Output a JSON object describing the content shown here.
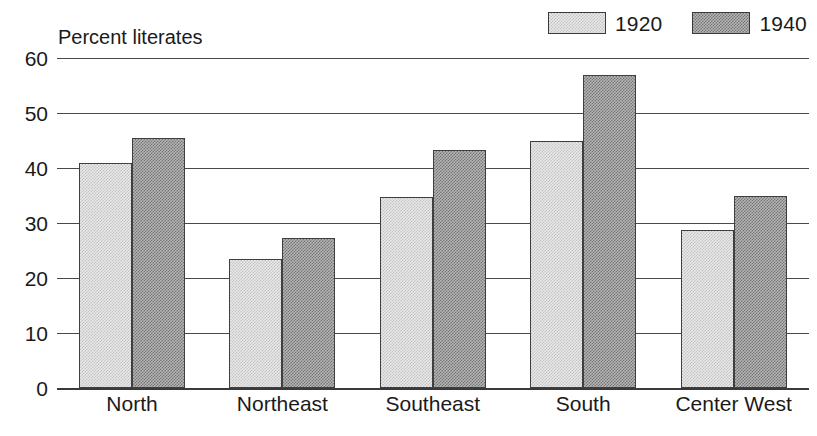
{
  "chart_data": {
    "type": "bar",
    "title": "Percent literates",
    "xlabel": "",
    "ylabel": "Percent literates",
    "ylim": [
      0,
      60
    ],
    "ytick_step": 10,
    "yticks": [
      0,
      10,
      20,
      30,
      40,
      50,
      60
    ],
    "ytick_labels": [
      "0",
      "10",
      "20",
      "30",
      "40",
      "50",
      "60"
    ],
    "grid": true,
    "grid_axis": "y",
    "legend_position": "top-right",
    "categories": [
      "North",
      "Northeast",
      "Southeast",
      "South",
      "Center West"
    ],
    "series": [
      {
        "name": "1920",
        "color": "#e0e0e0",
        "pattern": "light-dither",
        "values": [
          41.0,
          23.5,
          34.8,
          45.0,
          28.8
        ]
      },
      {
        "name": "1940",
        "color": "#9a9a9a",
        "pattern": "dark-dither",
        "values": [
          45.5,
          27.3,
          43.2,
          57.0,
          35.0
        ]
      }
    ]
  },
  "legend": {
    "entries": [
      {
        "label": "1920",
        "swatch": "light-dither-swatch"
      },
      {
        "label": "1940",
        "swatch": "dark-dither-swatch"
      }
    ]
  },
  "colors": {
    "axis": "#3a3a3a",
    "gridline": "#4a4a4a",
    "bar_edge": "#3f3f3f",
    "light_fill": "#e0e0e0",
    "dark_fill": "#9a9a9a",
    "background": "#ffffff",
    "text": "#1a1a1a"
  }
}
